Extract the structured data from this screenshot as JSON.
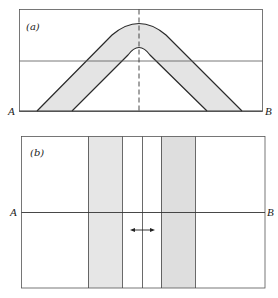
{
  "panels": [
    {
      "label": "(a)",
      "description": "Curved band (anticline fold) crossing line A–B, with dashed vertical axis at crest",
      "left_point": "A",
      "right_point": "B"
    },
    {
      "label": "(b)",
      "description": "Plan view: two shaded vertical bands symmetric about a central line, with double-headed arrow",
      "left_point": "A",
      "right_point": "B"
    }
  ],
  "colors": {
    "line": "#2a2a2a",
    "band_fill": "#e4e4e4",
    "background": "#ffffff"
  }
}
